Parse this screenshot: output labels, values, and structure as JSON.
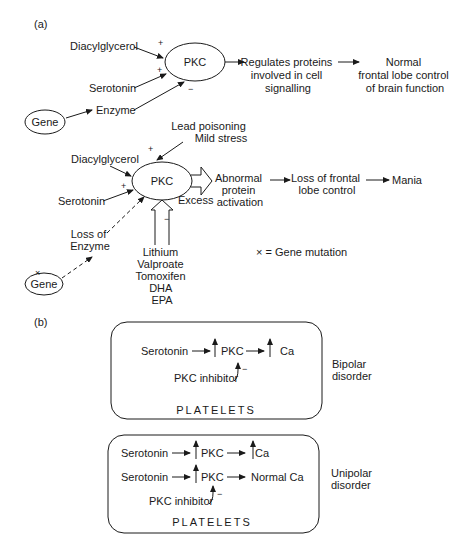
{
  "panel_a": {
    "label": "(a)",
    "normal": {
      "inputs": {
        "diacylglycerol": "Diacylglycerol",
        "serotonin": "Serotonin",
        "enzyme": "Enzyme",
        "gene": "Gene"
      },
      "signs": {
        "dag": "+",
        "serotonin": "+",
        "enzyme": "−"
      },
      "center": "PKC",
      "step1": [
        "Regulates proteins",
        "involved in cell",
        "signalling"
      ],
      "step2": [
        "Normal",
        "frontal lobe control",
        "of brain function"
      ]
    },
    "abnormal": {
      "top_inputs": [
        "Lead poisoning",
        "Mild stress"
      ],
      "inputs": {
        "diacylglycerol": "Diacylglycerol",
        "serotonin": "Serotonin",
        "loss_enzyme": [
          "Loss of",
          "Enzyme"
        ],
        "gene": "Gene"
      },
      "signs": {
        "top": "+",
        "serotonin": "+",
        "drugs": "−"
      },
      "center": "PKC",
      "excess_label": "Excess",
      "step1": [
        "Abnormal",
        "protein",
        "activation"
      ],
      "step2": [
        "Loss of frontal",
        "lobe control"
      ],
      "step3": "Mania",
      "drugs": [
        "Lithium",
        "Valproate",
        "Tomoxifen",
        "DHA",
        "EPA"
      ],
      "legend": "× = Gene mutation"
    }
  },
  "panel_b": {
    "label": "(b)",
    "bipolar": {
      "row1": {
        "input": "Serotonin",
        "mid": "PKC",
        "out": "Ca"
      },
      "inhibitor": "PKC inhibitor",
      "inhibitor_sign": "−",
      "box_label": "PLATELETS",
      "side_label": [
        "Bipolar",
        "disorder"
      ]
    },
    "unipolar": {
      "row1": {
        "input": "Serotonin",
        "mid": "PKC",
        "out": "Ca"
      },
      "row2": {
        "input": "Serotonin",
        "mid": "PKC",
        "out": "Normal Ca"
      },
      "inhibitor": "PKC inhibitor",
      "inhibitor_sign": "−",
      "box_label": "PLATELETS",
      "side_label": [
        "Unipolar",
        "disorder"
      ]
    }
  }
}
